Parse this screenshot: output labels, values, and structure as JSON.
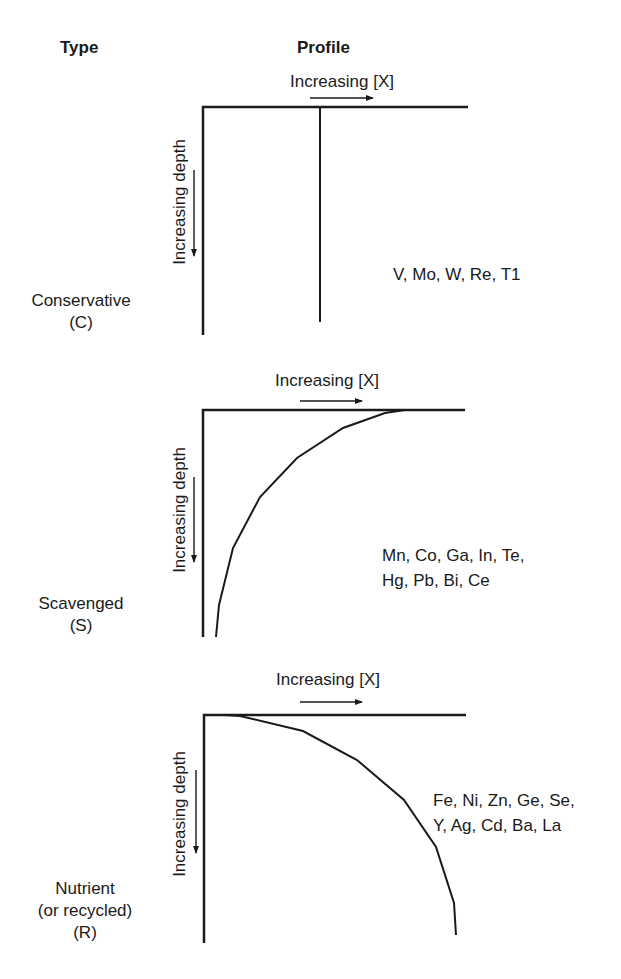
{
  "headers": {
    "type": "Type",
    "profile": "Profile"
  },
  "panels": [
    {
      "type_label": "Conservative",
      "type_code": "(C)",
      "x_axis_label": "Increasing [X]",
      "y_axis_label": "Increasing depth",
      "elements_line1": "V, Mo, W, Re, T1",
      "elements_line2": "",
      "profile_shape": "constant-vertical"
    },
    {
      "type_label": "Scavenged",
      "type_code": "(S)",
      "x_axis_label": "Increasing [X]",
      "y_axis_label": "Increasing depth",
      "elements_line1": "Mn, Co, Ga, In, Te,",
      "elements_line2": "Hg, Pb, Bi, Ce",
      "profile_shape": "high-at-surface-decreasing-with-depth"
    },
    {
      "type_label": "Nutrient",
      "type_label2": "(or recycled)",
      "type_code": "(R)",
      "x_axis_label": "Increasing [X]",
      "y_axis_label": "Increasing depth",
      "elements_line1": "Fe, Ni, Zn, Ge, Se,",
      "elements_line2": "Y, Ag, Cd, Ba, La",
      "profile_shape": "low-at-surface-increasing-with-depth"
    }
  ],
  "colors": {
    "line": "#1a1a1a",
    "background": "#ffffff"
  }
}
